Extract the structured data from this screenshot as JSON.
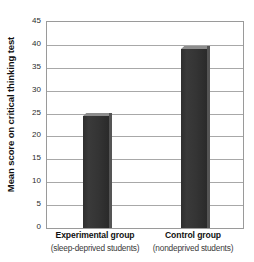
{
  "chart_data": {
    "type": "bar",
    "title": "",
    "xlabel": "",
    "ylabel": "Mean score on critical thinking test",
    "ylim": [
      0,
      45
    ],
    "ytick_step": 5,
    "yticks": [
      45,
      40,
      35,
      30,
      25,
      20,
      15,
      10,
      5,
      0
    ],
    "ytick_labels": [
      "45",
      "40",
      "35",
      "30",
      "25",
      "20",
      "15",
      "10",
      "5",
      "0"
    ],
    "categories": [
      "Experimental group",
      "Control group"
    ],
    "category_sublabels": [
      "(sleep-deprived students)",
      "(nondeprived students)"
    ],
    "values": [
      24.5,
      39
    ],
    "grid": true,
    "legend": false,
    "bar_color": "#333333",
    "bar_top_color": "#8d8d8d",
    "bar_side_color": "#555555",
    "grid_color": "#a8a8a8",
    "axis_color": "#9a9a9a",
    "background_color": "#ffffff"
  }
}
